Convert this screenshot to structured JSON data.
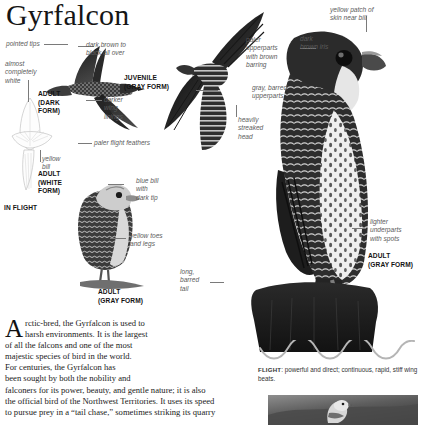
{
  "page": {
    "title": "Gyrfalcon",
    "background_color": "#ffffff",
    "text_color": "#1a1a1a",
    "label_color": "#5c5c5c"
  },
  "callouts": [
    {
      "id": "pointed-tips",
      "text": "pointed tips"
    },
    {
      "id": "almost-white",
      "text": "almost\ncompletely\nwhite"
    },
    {
      "id": "dark-brown-black",
      "text": "dark brown to\nblack all over"
    },
    {
      "id": "darker-wing-linings",
      "text": "darker\nwing\nlinings"
    },
    {
      "id": "paler-flight-feathers",
      "text": "paler flight feathers"
    },
    {
      "id": "yellow-bill",
      "text": "yellow\nbill"
    },
    {
      "id": "blue-bill",
      "text": "blue bill\nwith\ndark tip"
    },
    {
      "id": "yellow-toes",
      "text": "yellow toes\nand legs"
    },
    {
      "id": "long-barred-tail",
      "text": "long,\nbarred\ntail"
    },
    {
      "id": "paler-upperparts",
      "text": "paler\nupperparts\nwith brown\nbarring"
    },
    {
      "id": "gray-barred-upperparts",
      "text": "gray, barred\nupperparts"
    },
    {
      "id": "heavily-streaked-head",
      "text": "heavily\nstreaked\nhead"
    },
    {
      "id": "dark-brown-iris",
      "text": "dark\nbrown iris"
    },
    {
      "id": "yellow-patch-skin",
      "text": "yellow patch of\nskin near bill"
    },
    {
      "id": "lighter-underparts",
      "text": "lighter\nunderparts\nwith spots"
    }
  ],
  "plates": [
    {
      "id": "adult-dark-form",
      "text": "ADULT\n(DARK\nFORM)"
    },
    {
      "id": "adult-white-form",
      "text": "ADULT\n(WHITE\nFORM)"
    },
    {
      "id": "in-flight",
      "text": "IN FLIGHT"
    },
    {
      "id": "juvenile-gray-form",
      "text": "JUVENILE\n(GRAY FORM)"
    },
    {
      "id": "adult-gray-form-perched",
      "text": "ADULT\n(GRAY FORM)"
    },
    {
      "id": "adult-gray-form-large",
      "text": "ADULT\n(GRAY FORM)"
    }
  ],
  "body": {
    "dropcap": "A",
    "lines": [
      "rctic-bred, the Gyrfalcon is used to",
      "harsh environments. It is the largest",
      "of all the falcons and one of the most",
      "majestic species of bird in the world.",
      "For centuries, the Gyrfalcon has",
      "been sought by both the nobility and",
      "falconers for its power, beauty, and gentle nature; it is also",
      "the official bird of the Northwest Territories. It uses its speed",
      "to pursue prey in a “tail chase,” sometimes striking its quarry"
    ]
  },
  "flight": {
    "label": "FLIGHT",
    "separator": ":",
    "description": " powerful and direct; continuous, rapid, stiff wing beats."
  }
}
